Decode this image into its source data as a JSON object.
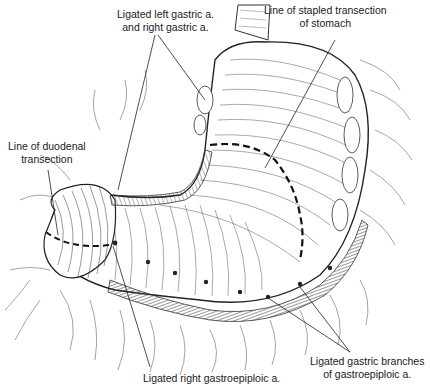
{
  "figure": {
    "colors": {
      "ink": "#1a1a1a",
      "background": "#ffffff",
      "hatch": "#555555"
    }
  },
  "labels": {
    "left_gastric": {
      "line1": "Ligated left gastric a.",
      "line2": "and right gastric a."
    },
    "stapled_transection": {
      "line1": "Line of stapled transection",
      "line2": "of stomach"
    },
    "duodenal_transection": {
      "line1": "Line of duodenal",
      "line2": "transection"
    },
    "gastric_branches": {
      "line1": "Ligated gastric branches",
      "line2": "of gastroepiploic a."
    },
    "right_gastroepiploic": {
      "line1": "Ligated right gastroepiploic a."
    }
  }
}
